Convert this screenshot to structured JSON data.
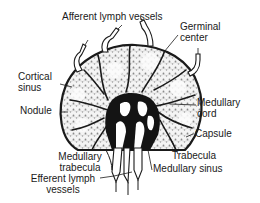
{
  "figure": {
    "labels": {
      "afferent": "Afferent lymph vessels",
      "germinal_1": "Germinal",
      "germinal_2": "center",
      "cortical_1": "Cortical",
      "cortical_2": "sinus",
      "nodule": "Nodule",
      "medcord_1": "Medullary",
      "medcord_2": "cord",
      "capsule": "Capsule",
      "trabecula": "Trabecula",
      "medtrab_1": "Medullary",
      "medtrab_2": "trabecula",
      "medsinus": "Medullary sinus",
      "efferent_1": "Efferent lymph",
      "efferent_2": "vessels"
    },
    "colors": {
      "ink": "#1a1a1a",
      "background": "#ffffff",
      "stipple": "#9a9a9a"
    }
  }
}
